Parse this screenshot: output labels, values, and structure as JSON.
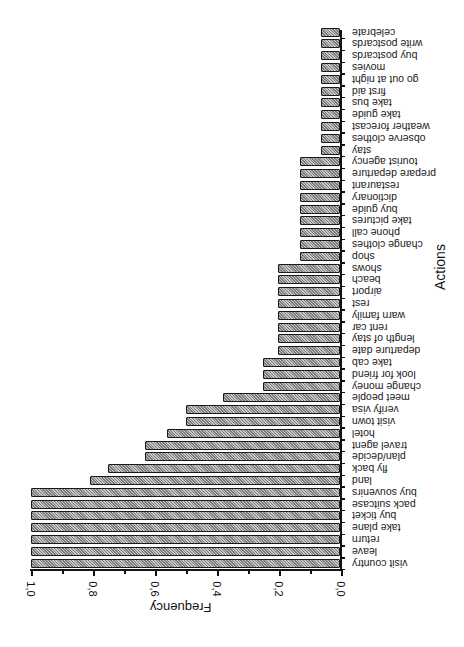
{
  "chart_data": {
    "type": "bar",
    "orientation": "horizontal",
    "image_rotation_deg": 180,
    "title": "",
    "xlabel": "Frequency",
    "ylabel": "Actions",
    "xlim": [
      0.0,
      1.0
    ],
    "x_ticks": [
      "0,0",
      "0,2",
      "0,4",
      "0,6",
      "0,8",
      "1,0"
    ],
    "grid": false,
    "categories": [
      "visit country",
      "leave",
      "return",
      "take plane",
      "buy ticket",
      "pack suitcase",
      "buy souvenirs",
      "land",
      "fly back",
      "plan/decide",
      "travel agent",
      "hotel",
      "visit town",
      "verify visa",
      "meet people",
      "change money",
      "look for friend",
      "take cab",
      "departure date",
      "length of stay",
      "rent car",
      "warn family",
      "rest",
      "airport",
      "beach",
      "shows",
      "shop",
      "change clothes",
      "phone call",
      "take pictures",
      "buy guide",
      "dictionary",
      "restaurant",
      "prepare departure",
      "tourist agency",
      "stay",
      "observe clothes",
      "weather forecast",
      "take guide",
      "take bus",
      "first aid",
      "go out at night",
      "movies",
      "buy postcards",
      "write postcards",
      "celebrate"
    ],
    "values": [
      1.0,
      1.0,
      1.0,
      1.0,
      1.0,
      1.0,
      1.0,
      0.81,
      0.75,
      0.63,
      0.63,
      0.56,
      0.5,
      0.5,
      0.38,
      0.25,
      0.25,
      0.25,
      0.2,
      0.2,
      0.2,
      0.2,
      0.2,
      0.2,
      0.2,
      0.2,
      0.13,
      0.13,
      0.13,
      0.13,
      0.13,
      0.13,
      0.13,
      0.13,
      0.13,
      0.06,
      0.06,
      0.06,
      0.06,
      0.06,
      0.06,
      0.06,
      0.06,
      0.06,
      0.06,
      0.06
    ]
  },
  "axis": {
    "x_label": "Frequency",
    "y_label": "Actions",
    "tick_labels": [
      "1,0",
      "0,8",
      "0,6",
      "0,4",
      "0,2",
      "0,0"
    ]
  }
}
